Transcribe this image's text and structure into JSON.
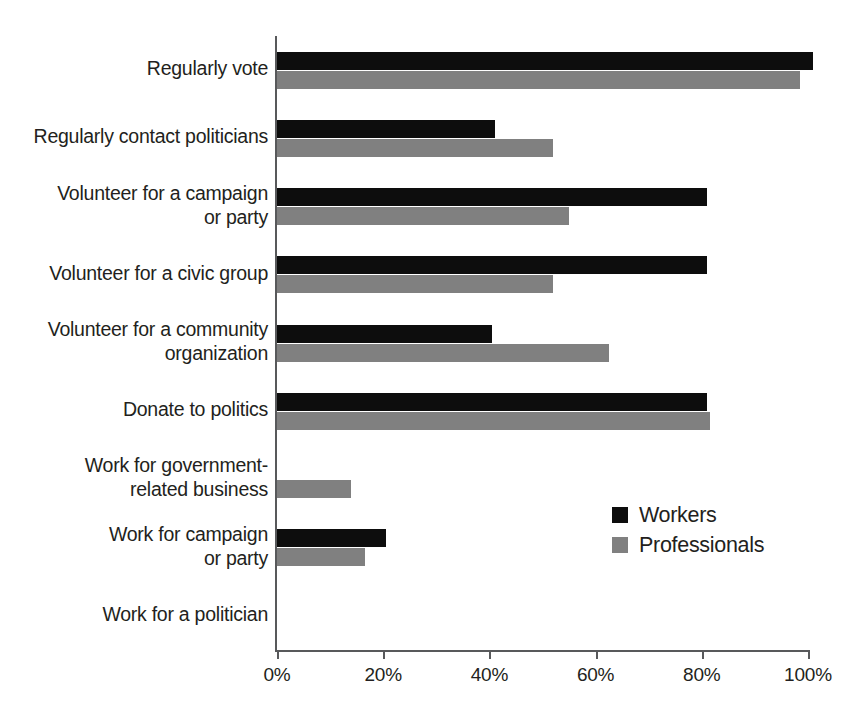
{
  "chart_data": {
    "type": "bar",
    "orientation": "horizontal",
    "title": "",
    "subtitle": "",
    "xlabel": "",
    "ylabel": "",
    "xlim": [
      0,
      100
    ],
    "grid": false,
    "legend_position": "inside-right",
    "x_unit": "%",
    "x_tick_labels": [
      "0%",
      "20%",
      "40%",
      "60%",
      "80%",
      "100%"
    ],
    "x_tick_values": [
      0,
      20,
      40,
      60,
      80,
      100
    ],
    "categories": [
      "Regularly vote",
      "Regularly contact politicians",
      "Volunteer for a campaign or party",
      "Volunteer for a civic group",
      "Volunteer for a community organization",
      "Donate to politics",
      "Work for government-related business",
      "Work for campaign or party",
      "Work for a politician"
    ],
    "category_label_lines": [
      [
        "Regularly vote"
      ],
      [
        "Regularly contact politicians"
      ],
      [
        "Volunteer for a campaign",
        "or party"
      ],
      [
        "Volunteer for a civic group"
      ],
      [
        "Volunteer for a community",
        "organization"
      ],
      [
        "Donate to politics"
      ],
      [
        "Work for government-",
        "related business"
      ],
      [
        "Work for campaign",
        "or party"
      ],
      [
        "Work for a politician"
      ]
    ],
    "series": [
      {
        "name": "Workers",
        "color": "#0d0d0d",
        "values": [
          101,
          41,
          81,
          81,
          40.5,
          81,
          0,
          20.5,
          0
        ]
      },
      {
        "name": "Professionals",
        "color": "#808080",
        "values": [
          98.5,
          52,
          55,
          52,
          62.5,
          81.5,
          14,
          16.5,
          0
        ]
      }
    ]
  },
  "legend": {
    "items": [
      {
        "label": "Workers",
        "swatch": "workers"
      },
      {
        "label": "Professionals",
        "swatch": "professionals"
      }
    ]
  },
  "colors": {
    "workers": "#0d0d0d",
    "professionals": "#808080",
    "axis": "#58595b",
    "text": "#231f20",
    "background": "#ffffff"
  }
}
